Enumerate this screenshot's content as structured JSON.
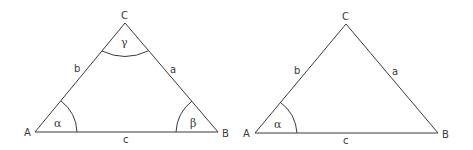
{
  "diagrams": [
    {
      "name": "triangle-all-angles",
      "vertices": {
        "A": "A",
        "B": "B",
        "C": "C"
      },
      "sides": {
        "a": "a",
        "b": "b",
        "c": "c"
      },
      "angles": {
        "alpha": "α",
        "beta": "β",
        "gamma": "γ"
      }
    },
    {
      "name": "triangle-alpha-only",
      "vertices": {
        "A": "A",
        "B": "B",
        "C": "C"
      },
      "sides": {
        "a": "a",
        "b": "b",
        "c": "c"
      },
      "angles": {
        "alpha": "α"
      }
    }
  ],
  "colors": {
    "stroke": "#3a3a3a",
    "background": "#ffffff"
  }
}
